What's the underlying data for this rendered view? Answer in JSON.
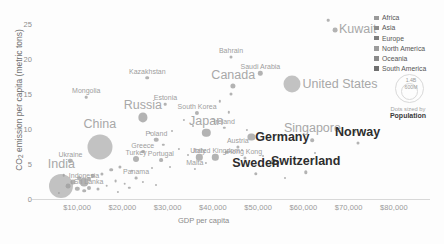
{
  "chart_data": {
    "type": "scatter",
    "title": "",
    "xlabel": "GDP per capita",
    "ylabel": "CO₂ emission per capita (metric tons)",
    "xlim": [
      0,
      88000
    ],
    "ylim": [
      0,
      26.5
    ],
    "grid": false,
    "xticks": [
      "$10,000",
      "$20,000",
      "$30,000",
      "$40,000",
      "$50,000",
      "$60,000",
      "$70,000",
      "$80,000"
    ],
    "xtick_values": [
      10000,
      20000,
      30000,
      40000,
      50000,
      60000,
      70000,
      80000
    ],
    "yticks": [
      "0",
      "5",
      "10",
      "15",
      "20",
      "25"
    ],
    "ytick_values": [
      0,
      5,
      10,
      15,
      20,
      25
    ],
    "size_encoding": "Population",
    "points": [
      {
        "name": "Kuwait",
        "x": 67000,
        "y": 24.2,
        "r": 2.4,
        "tier": "big",
        "lx": 0,
        "ly": -1,
        "anchor": "right"
      },
      {
        "name": "Bahrain",
        "x": 44000,
        "y": 20.3,
        "r": 1.5,
        "tier": "small",
        "lx": 0,
        "ly": -7
      },
      {
        "name": "Kazakhstan",
        "x": 25500,
        "y": 17.4,
        "r": 1.8,
        "tier": "small",
        "lx": 0,
        "ly": -7
      },
      {
        "name": "Saudi Arabia",
        "x": 50500,
        "y": 18.0,
        "r": 2.2,
        "tier": "small",
        "lx": 0,
        "ly": -7
      },
      {
        "name": "United States",
        "x": 57500,
        "y": 16.5,
        "r": 8.5,
        "tier": "big",
        "lx": 48,
        "ly": 0
      },
      {
        "name": "Canada",
        "x": 44500,
        "y": 16.2,
        "r": 2.6,
        "tier": "big",
        "lx": 0,
        "ly": -11
      },
      {
        "name": "Mongolia",
        "x": 12000,
        "y": 14.6,
        "r": 1.3,
        "tier": "small",
        "lx": 0,
        "ly": -7
      },
      {
        "name": "Estonia",
        "x": 29500,
        "y": 13.6,
        "r": 1.3,
        "tier": "small",
        "lx": 0,
        "ly": -7
      },
      {
        "name": "Russia",
        "x": 24500,
        "y": 11.7,
        "r": 4.6,
        "tier": "big",
        "lx": 0,
        "ly": -12
      },
      {
        "name": "South Korea",
        "x": 36500,
        "y": 12.3,
        "r": 2.1,
        "tier": "small",
        "lx": 0,
        "ly": -7
      },
      {
        "name": "Japan",
        "x": 38500,
        "y": 9.5,
        "r": 4.2,
        "tier": "big",
        "lx": 0,
        "ly": -12
      },
      {
        "name": "China",
        "x": 15000,
        "y": 7.4,
        "r": 12.5,
        "tier": "big",
        "lx": 0,
        "ly": -23
      },
      {
        "name": "Poland",
        "x": 27500,
        "y": 8.5,
        "r": 2.3,
        "tier": "small",
        "lx": 0,
        "ly": -7
      },
      {
        "name": "Germany",
        "x": 48500,
        "y": 8.9,
        "r": 3.6,
        "tier": "bold",
        "lx": 31,
        "ly": 0
      },
      {
        "name": "Ireland",
        "x": 42500,
        "y": 10.2,
        "r": 1.2,
        "tier": "small",
        "lx": 0,
        "ly": -7
      },
      {
        "name": "Singapore",
        "x": 62000,
        "y": 8.4,
        "r": 1.8,
        "tier": "big",
        "lx": 0,
        "ly": -12
      },
      {
        "name": "Norway",
        "x": 72000,
        "y": 8.0,
        "r": 1.5,
        "tier": "bold",
        "lx": 0,
        "ly": -11
      },
      {
        "name": "Austria",
        "x": 45500,
        "y": 7.5,
        "r": 1.6,
        "tier": "small",
        "lx": 0,
        "ly": -7
      },
      {
        "name": "Greece",
        "x": 24500,
        "y": 6.8,
        "r": 1.9,
        "tier": "small",
        "lx": 0,
        "ly": -7
      },
      {
        "name": "Portugal",
        "x": 28500,
        "y": 5.6,
        "r": 1.9,
        "tier": "small",
        "lx": 0,
        "ly": -7
      },
      {
        "name": "Italy",
        "x": 37000,
        "y": 6.0,
        "r": 3.2,
        "tier": "small",
        "lx": 0,
        "ly": -7
      },
      {
        "name": "United Kingdom",
        "x": 40500,
        "y": 6.0,
        "r": 3.2,
        "tier": "small",
        "lx": 0,
        "ly": -7
      },
      {
        "name": "Hong Kong",
        "x": 47000,
        "y": 5.9,
        "r": 1.6,
        "tier": "small",
        "lx": 0,
        "ly": -7
      },
      {
        "name": "Turkey",
        "x": 23000,
        "y": 5.8,
        "r": 3.0,
        "tier": "small",
        "lx": 0,
        "ly": -7
      },
      {
        "name": "Ukraine",
        "x": 8500,
        "y": 5.5,
        "r": 2.2,
        "tier": "small",
        "lx": 0,
        "ly": -7
      },
      {
        "name": "Malta",
        "x": 36000,
        "y": 4.3,
        "r": 1.1,
        "tier": "small",
        "lx": 0,
        "ly": -7
      },
      {
        "name": "Sweden",
        "x": 49500,
        "y": 3.6,
        "r": 1.7,
        "tier": "bold",
        "lx": 0,
        "ly": -11
      },
      {
        "name": "Switzerland",
        "x": 60500,
        "y": 3.8,
        "r": 1.7,
        "tier": "bold",
        "lx": 0,
        "ly": -11
      },
      {
        "name": "India",
        "x": 6500,
        "y": 1.8,
        "r": 12.0,
        "tier": "big",
        "lx": 0,
        "ly": -22
      },
      {
        "name": "Indonesia",
        "x": 11500,
        "y": 2.4,
        "r": 4.4,
        "tier": "small",
        "lx": 0,
        "ly": -7
      },
      {
        "name": "Sri Lanka",
        "x": 12500,
        "y": 1.6,
        "r": 2.0,
        "tier": "small",
        "lx": 0,
        "ly": -7
      },
      {
        "name": "Panama",
        "x": 23000,
        "y": 3.0,
        "r": 1.4,
        "tier": "small",
        "lx": 0,
        "ly": -7
      }
    ],
    "unlabeled_points": [
      {
        "x": 41500,
        "y": 14.0,
        "r": 1.2
      },
      {
        "x": 43500,
        "y": 12.4,
        "r": 1.2
      },
      {
        "x": 44000,
        "y": 15.0,
        "r": 1.5
      },
      {
        "x": 33500,
        "y": 11.3,
        "r": 1.1
      },
      {
        "x": 35500,
        "y": 10.5,
        "r": 1.0
      },
      {
        "x": 31000,
        "y": 9.7,
        "r": 1.0
      },
      {
        "x": 26000,
        "y": 9.5,
        "r": 1.0
      },
      {
        "x": 29000,
        "y": 7.8,
        "r": 1.2
      },
      {
        "x": 32500,
        "y": 7.2,
        "r": 1.1
      },
      {
        "x": 34500,
        "y": 6.3,
        "r": 1.0
      },
      {
        "x": 43000,
        "y": 6.7,
        "r": 1.2
      },
      {
        "x": 46500,
        "y": 7.0,
        "r": 1.0
      },
      {
        "x": 51000,
        "y": 6.2,
        "r": 1.0
      },
      {
        "x": 53000,
        "y": 5.4,
        "r": 1.0
      },
      {
        "x": 38500,
        "y": 5.2,
        "r": 1.1
      },
      {
        "x": 30500,
        "y": 4.6,
        "r": 1.0
      },
      {
        "x": 26500,
        "y": 4.4,
        "r": 1.0
      },
      {
        "x": 22000,
        "y": 4.0,
        "r": 1.2
      },
      {
        "x": 19500,
        "y": 4.6,
        "r": 1.6
      },
      {
        "x": 17500,
        "y": 4.2,
        "r": 1.8
      },
      {
        "x": 15500,
        "y": 3.6,
        "r": 1.6
      },
      {
        "x": 13500,
        "y": 3.3,
        "r": 2.2
      },
      {
        "x": 10500,
        "y": 3.0,
        "r": 1.8
      },
      {
        "x": 9000,
        "y": 2.4,
        "r": 2.6
      },
      {
        "x": 8000,
        "y": 1.9,
        "r": 2.4
      },
      {
        "x": 10000,
        "y": 1.5,
        "r": 2.2
      },
      {
        "x": 11500,
        "y": 1.2,
        "r": 1.8
      },
      {
        "x": 14500,
        "y": 1.4,
        "r": 1.5
      },
      {
        "x": 16500,
        "y": 1.9,
        "r": 1.3
      },
      {
        "x": 18500,
        "y": 2.6,
        "r": 1.4
      },
      {
        "x": 20500,
        "y": 2.2,
        "r": 1.3
      },
      {
        "x": 12500,
        "y": 2.8,
        "r": 2.0
      },
      {
        "x": 7000,
        "y": 3.4,
        "r": 1.3
      },
      {
        "x": 21500,
        "y": 1.6,
        "r": 1.2
      },
      {
        "x": 24500,
        "y": 2.4,
        "r": 1.1
      },
      {
        "x": 27500,
        "y": 2.0,
        "r": 1.0
      },
      {
        "x": 6000,
        "y": 0.9,
        "r": 1.1
      },
      {
        "x": 19000,
        "y": 1.0,
        "r": 1.1
      },
      {
        "x": 56000,
        "y": 3.0,
        "r": 1.0
      },
      {
        "x": 62500,
        "y": 6.6,
        "r": 1.0
      },
      {
        "x": 71500,
        "y": 9.6,
        "r": 1.0
      },
      {
        "x": 65500,
        "y": 25.6,
        "r": 1.3
      },
      {
        "x": 47500,
        "y": 9.9,
        "r": 1.1
      },
      {
        "x": 40000,
        "y": 11.4,
        "r": 1.0
      }
    ],
    "legend": {
      "position": "top-right",
      "entries": [
        {
          "label": "Africa",
          "color": "#9a9a9a"
        },
        {
          "label": "Asia",
          "color": "#8c8c8c"
        },
        {
          "label": "Europe",
          "color": "#7d7d7d"
        },
        {
          "label": "North America",
          "color": "#9c9c9c"
        },
        {
          "label": "Oceania",
          "color": "#8a8a8a"
        },
        {
          "label": "South America",
          "color": "#6f6f6f"
        }
      ]
    },
    "size_legend": {
      "big_label": "1.4B",
      "small_label": "600M",
      "caption": "Dots sized by",
      "caption_strong": "Population"
    }
  },
  "colors": {
    "background": "#fdfdfd",
    "axis": "#d8d8d8",
    "tick_text": "#9a9a9a",
    "axis_title": "#6f6f6f",
    "dot": "#9e9e9e",
    "label_big": "#a8a8a8",
    "label_bold": "#2e2e2e",
    "label_small": "#9d9d9d"
  }
}
